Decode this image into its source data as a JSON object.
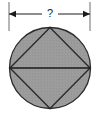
{
  "figure": {
    "background_color": "#ffffff",
    "dimension": {
      "label": "?",
      "label_x": 50,
      "label_y": 14,
      "line_y": 14,
      "left_x": 9,
      "right_x": 90,
      "extension_top_y": 2,
      "extension_bottom_y": 31,
      "arrow_style": "filled-triangle-both-ends",
      "line_color": "#1a1a1a",
      "measures": "diameter"
    },
    "circle": {
      "center_x": 50,
      "center_y": 68,
      "radius": 40.5,
      "fill_color": "#9a9a9a",
      "stroke_color": "#2b2b2b",
      "stroke_width": 1.3
    },
    "inscribed_square": {
      "orientation": "rotated-45-diamond",
      "vertices": [
        {
          "name": "top",
          "x": 50,
          "y": 27.5
        },
        {
          "name": "right",
          "x": 90,
          "y": 68
        },
        {
          "name": "bottom",
          "x": 50,
          "y": 108.5
        },
        {
          "name": "left",
          "x": 10,
          "y": 68
        }
      ],
      "fill_color": "none",
      "stroke_color": "#2b2b2b",
      "stroke_width": 1.4
    },
    "diagonal": {
      "name": "horizontal-diagonal",
      "x1": 10,
      "y1": 68,
      "x2": 90,
      "y2": 68,
      "stroke_color": "#1a1a1a",
      "stroke_width": 1.6
    }
  }
}
